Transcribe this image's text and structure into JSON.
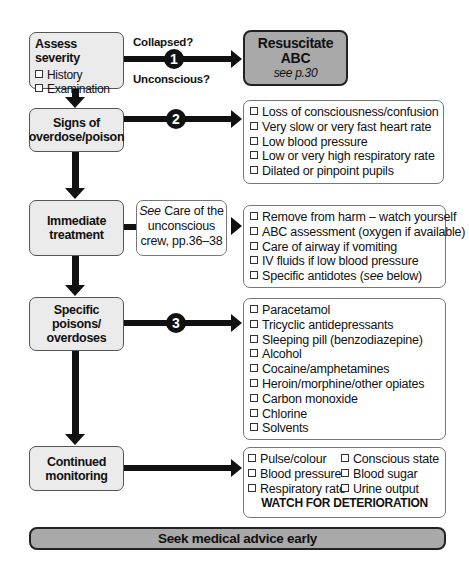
{
  "assess": {
    "title": "Assess severity",
    "items": [
      "History",
      "Examination"
    ]
  },
  "branch1": {
    "badge": "1",
    "question_top": "Collapsed?",
    "question_bottom": "Unconscious?"
  },
  "resuscitate": {
    "line1": "Resuscitate",
    "line2": "ABC",
    "ref": "see p.30"
  },
  "signs": {
    "line1": "Signs of",
    "line2": "overdose/poison",
    "badge": "2",
    "items": [
      "Loss of consciousness/confusion",
      "Very slow or very fast heart rate",
      "Low blood pressure",
      "Low or very high respiratory rate",
      "Dilated or pinpoint pupils"
    ]
  },
  "treatment": {
    "line1": "Immediate",
    "line2": "treatment",
    "see_box": {
      "see": "See",
      "line1_rest": " Care of the",
      "line2": "unconscious",
      "line3": "crew, pp.36–38"
    },
    "items": [
      {
        "text": "Remove from harm – watch yourself"
      },
      {
        "text": "ABC assessment (oxygen if available)"
      },
      {
        "text": "Care of airway if vomiting"
      },
      {
        "text": "IV fluids if low blood pressure"
      },
      {
        "text_before": "Specific antidotes (",
        "italic": "see",
        "text_after": " below)"
      }
    ]
  },
  "poisons": {
    "line1": "Specific",
    "line2": "poisons/",
    "line3": "overdoses",
    "badge": "3",
    "items": [
      "Paracetamol",
      "Tricyclic antidepressants",
      "Sleeping pill (benzodiazepine)",
      "Alcohol",
      "Cocaine/amphetamines",
      "Heroin/morphine/other opiates",
      "Carbon monoxide",
      "Chlorine",
      "Solvents"
    ]
  },
  "monitoring": {
    "line1": "Continued",
    "line2": "monitoring",
    "col1": [
      "Pulse/colour",
      "Blood pressure",
      "Respiratory rate"
    ],
    "col2": [
      "Conscious state",
      "Blood sugar",
      "Urine output"
    ],
    "warning": "WATCH FOR DETERIORATION"
  },
  "footer": {
    "label": "Seek medical advice early"
  },
  "colors": {
    "node_fill": "#ebebeb",
    "resuscitate_fill": "#a9a9a9",
    "footer_fill": "#a9a9a9",
    "line": "#111111"
  }
}
